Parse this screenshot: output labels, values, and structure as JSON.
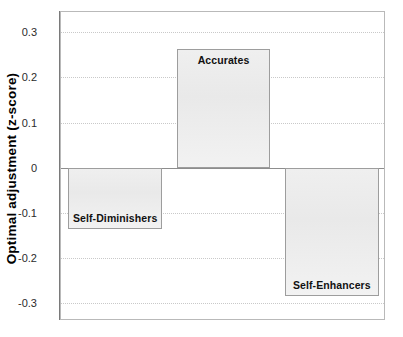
{
  "chart_data": {
    "type": "bar",
    "title": "",
    "xlabel": "",
    "ylabel": "Optimal adjustment (z-score)",
    "categories": [
      "Self-Diminishers",
      "Accurates",
      "Self-Enhancers"
    ],
    "values": [
      -0.135,
      0.262,
      -0.284
    ],
    "ylim": [
      -0.34,
      0.345
    ],
    "yticks": [
      0.3,
      0.2,
      0.1,
      0,
      -0.1,
      -0.2,
      -0.3
    ],
    "ytick_labels": [
      "0.3",
      "0.2",
      "0.1",
      "0",
      "-0.1",
      "-0.2",
      "-0.3"
    ],
    "grid": true,
    "grid_style": "dotted",
    "legend": "none",
    "bar_fill": "#ededed",
    "bar_edge": "#9d9d9d",
    "zero_line": 0,
    "data_labels_inside_bars": true
  },
  "axis": {
    "y_title": "Optimal adjustment (z-score)"
  },
  "bars": [
    {
      "label": "Self-Diminishers",
      "value": -0.135,
      "label_position": "inside-bottom"
    },
    {
      "label": "Accurates",
      "value": 0.262,
      "label_position": "inside-top"
    },
    {
      "label": "Self-Enhancers",
      "value": -0.284,
      "label_position": "inside-bottom"
    }
  ],
  "ticks": [
    {
      "label": "0.3",
      "value": 0.3
    },
    {
      "label": "0.2",
      "value": 0.2
    },
    {
      "label": "0.1",
      "value": 0.1
    },
    {
      "label": "0",
      "value": 0.0
    },
    {
      "label": "-0.1",
      "value": -0.1
    },
    {
      "label": "-0.2",
      "value": -0.2
    },
    {
      "label": "-0.3",
      "value": -0.3
    }
  ]
}
